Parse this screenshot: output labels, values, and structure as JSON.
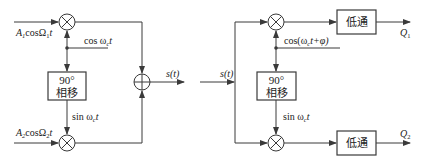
{
  "diagram": {
    "modulator": {
      "input_top": {
        "amp": "A",
        "amp_sub": "1",
        "func": "cosΩ",
        "func_sub": "1",
        "var": "t"
      },
      "input_bottom": {
        "amp": "A",
        "amp_sub": "2",
        "func": "cosΩ",
        "func_sub": "2",
        "var": "t"
      },
      "carrier": {
        "func": "cos ω",
        "sub": "c",
        "var": "t"
      },
      "shifted_carrier": {
        "func": "sin ω",
        "sub": "c",
        "var": "t"
      },
      "phase_shifter": {
        "line1": "90°",
        "line2": "相移"
      },
      "output": "s(t)",
      "multiplier_symbol": "⊗",
      "adder_symbol": "⊕"
    },
    "demodulator": {
      "input": "s(t)",
      "carrier": {
        "func": "cos(ω",
        "sub": "c",
        "rest": "t+φ)"
      },
      "shifted_carrier": {
        "func": "sin ω",
        "sub": "c",
        "var": "t"
      },
      "phase_shifter": {
        "line1": "90°",
        "line2": "相移"
      },
      "lowpass_top": "低通",
      "lowpass_bottom": "低通",
      "output_top": {
        "name": "Q",
        "sub": "1"
      },
      "output_bottom": {
        "name": "Q",
        "sub": "2"
      }
    }
  },
  "colors": {
    "line": "#3a3a3a",
    "background": "#ffffff",
    "text": "#222222"
  }
}
